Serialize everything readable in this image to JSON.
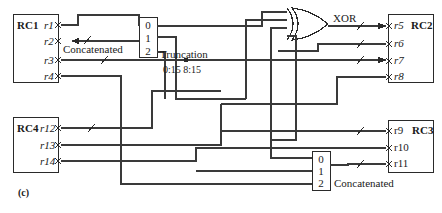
{
  "figure": {
    "caption": "(c)",
    "registers": [
      {
        "id": "RC1",
        "name": "RC1",
        "ports": [
          "r1",
          "r2",
          "r3",
          "r4"
        ],
        "box": {
          "x": 13,
          "y": 14,
          "w": 45,
          "h": 68
        },
        "name_pos": {
          "x": 17,
          "y": 21
        },
        "port_rows": [
          25,
          41,
          60,
          76
        ],
        "port_side": "right"
      },
      {
        "id": "RC2",
        "name": "RC2",
        "ports": [
          "r5",
          "r6",
          "r7",
          "r8"
        ],
        "box": {
          "x": 388,
          "y": 14,
          "w": 45,
          "h": 68
        },
        "name_pos": {
          "x": 411,
          "y": 21
        },
        "port_rows": [
          26,
          44,
          61,
          77
        ],
        "port_side": "left"
      },
      {
        "id": "RC3",
        "name": "RC3",
        "ports": [
          "r9",
          "r10",
          "r11"
        ],
        "box": {
          "x": 388,
          "y": 120,
          "w": 45,
          "h": 52
        },
        "name_pos": {
          "x": 411,
          "y": 126
        },
        "port_rows": [
          131,
          148,
          164
        ],
        "port_side": "left"
      },
      {
        "id": "RC4",
        "name": "RC4",
        "ports": [
          "r12",
          "r13",
          "r14"
        ],
        "box": {
          "x": 13,
          "y": 117,
          "w": 45,
          "h": 55
        },
        "name_pos": {
          "x": 17,
          "y": 124
        },
        "port_rows": [
          128,
          145,
          161
        ],
        "port_side": "right"
      }
    ],
    "multiplexers": [
      {
        "id": "mux-top",
        "box": {
          "x": 139,
          "y": 17,
          "w": 18,
          "h": 40
        },
        "selectors": [
          "0",
          "1",
          "2"
        ],
        "label": "Concatenated",
        "label_pos": {
          "x": 63,
          "y": 45
        }
      },
      {
        "id": "mux-bottom",
        "box": {
          "x": 312,
          "y": 151,
          "w": 18,
          "h": 39
        },
        "selectors": [
          "0",
          "1",
          "2"
        ],
        "label": "Concatenated",
        "label_pos": {
          "x": 334,
          "y": 179
        }
      }
    ],
    "gates": [
      {
        "id": "xor-gate",
        "label": "XOR",
        "label_pos": {
          "x": 333,
          "y": 14
        },
        "shape": {
          "x": 292,
          "y": 8,
          "w": 36,
          "h": 32
        }
      }
    ],
    "annotations": [
      {
        "id": "truncation-label",
        "text": "Truncation",
        "x": 160,
        "y": 50
      },
      {
        "id": "truncation-bits",
        "text": "0:15   8:15",
        "x": 163,
        "y": 66
      }
    ]
  }
}
